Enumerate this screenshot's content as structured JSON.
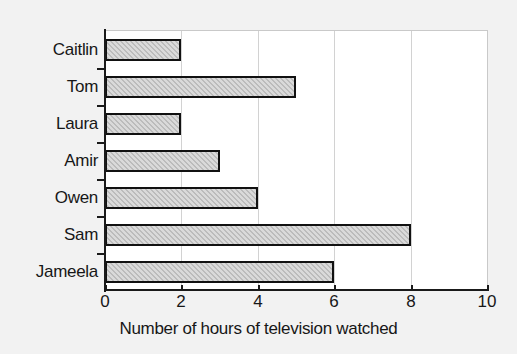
{
  "chart_data": {
    "type": "bar",
    "orientation": "horizontal",
    "title": "",
    "xlabel": "Number of hours of television watched",
    "ylabel": "",
    "categories": [
      "Caitlin",
      "Tom",
      "Laura",
      "Amir",
      "Owen",
      "Sam",
      "Jameela"
    ],
    "values": [
      2,
      5,
      2,
      3,
      4,
      8,
      6
    ],
    "xlim": [
      0,
      10
    ],
    "xticks": [
      0,
      2,
      4,
      6,
      8,
      10
    ],
    "xtick_labels": [
      "0",
      "2",
      "4",
      "6",
      "8",
      "10"
    ],
    "grid": "vertical",
    "legend": "none",
    "bar_fill": "#bcbcbc",
    "bar_edge": "#111111",
    "plot_background": "#ffffff",
    "page_background": "#f2f2f2",
    "gridline_color": "#d2d2d2",
    "axis_color": "#1a1a1a",
    "text_color": "#171717"
  }
}
